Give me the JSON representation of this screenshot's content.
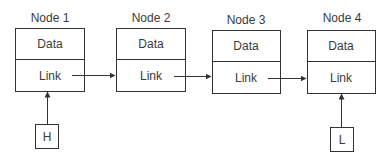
{
  "diagram": {
    "type": "singly-linked-list",
    "nodes": [
      {
        "title": "Node 1",
        "data_label": "Data",
        "link_label": "Link"
      },
      {
        "title": "Node 2",
        "data_label": "Data",
        "link_label": "Link"
      },
      {
        "title": "Node 3",
        "data_label": "Data",
        "link_label": "Link"
      },
      {
        "title": "Node 4",
        "data_label": "Data",
        "link_label": "Link"
      }
    ],
    "pointers": [
      {
        "label": "H",
        "points_to": "Node 1"
      },
      {
        "label": "L",
        "points_to": "Node 4"
      }
    ],
    "edges": [
      {
        "from": "Node 1",
        "to": "Node 2"
      },
      {
        "from": "Node 2",
        "to": "Node 3"
      },
      {
        "from": "Node 3",
        "to": "Node 4"
      }
    ],
    "colors": {
      "stroke": "#333333",
      "text": "#3a3a3a",
      "background": "#ffffff"
    }
  }
}
